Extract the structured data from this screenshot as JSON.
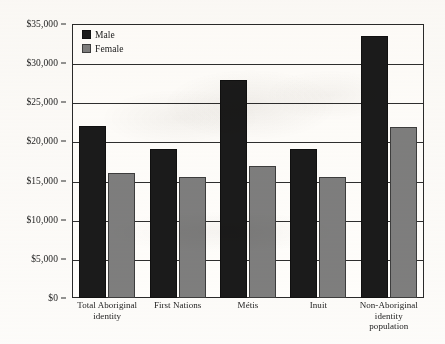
{
  "chart_data": {
    "type": "bar",
    "title": "",
    "subtitle": "",
    "xlabel": "",
    "ylabel": "",
    "ylim": [
      0,
      35000
    ],
    "ytick_labels": [
      "$35,000",
      "$30,000",
      "$25,000",
      "$20,000",
      "$15,000",
      "$10,000",
      "$5,000",
      "$0"
    ],
    "ytick_values": [
      35000,
      30000,
      25000,
      20000,
      15000,
      10000,
      5000,
      0
    ],
    "ytick_step": 5000,
    "grid": true,
    "legend_position": "top-left",
    "categories": [
      "Total Aboriginal identity",
      "First Nations",
      "Métis",
      "Inuit",
      "Non-Aboriginal identity population"
    ],
    "category_lines": [
      [
        "Total Aboriginal",
        "identity"
      ],
      [
        "First Nations"
      ],
      [
        "Métis"
      ],
      [
        "Inuit"
      ],
      [
        "Non-Aboriginal",
        "identity",
        "population"
      ]
    ],
    "series": [
      {
        "name": "Male",
        "color": "#1b1b1b",
        "values": [
          22000,
          19000,
          27800,
          19000,
          33500
        ]
      },
      {
        "name": "Female",
        "color": "#7e7e7e",
        "values": [
          16000,
          15400,
          16900,
          15400,
          21800
        ]
      }
    ]
  },
  "legend": {
    "items": [
      {
        "label": "Male",
        "swatch": "male"
      },
      {
        "label": "Female",
        "swatch": "female"
      }
    ]
  }
}
